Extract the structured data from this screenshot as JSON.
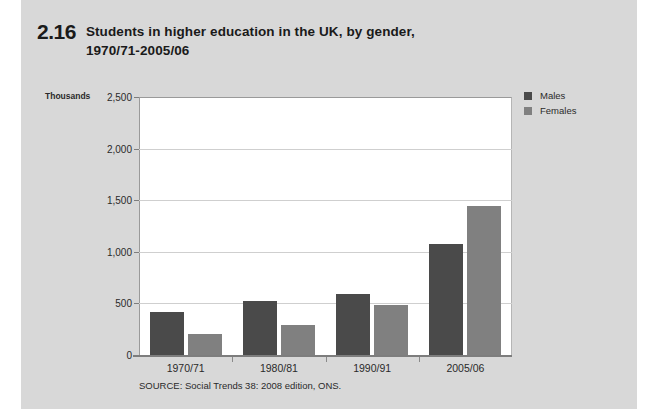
{
  "figure": {
    "number": "2.16",
    "title_line1": "Students in higher education in the UK, by gender,",
    "title_line2": "1970/71-2005/06",
    "source": "SOURCE: Social Trends 38: 2008 edition, ONS.",
    "panel_color": "#d8d8d8"
  },
  "chart_data": {
    "type": "bar",
    "title": "Students in higher education in the UK, by gender, 1970/71-2005/06",
    "xlabel": "",
    "ylabel": "Thousands",
    "unit_label": "Thousands",
    "categories": [
      "1970/71",
      "1980/81",
      "1990/91",
      "2005/06"
    ],
    "series": [
      {
        "name": "Males",
        "color": "#4a4a4a",
        "values": [
          416,
          526,
          588,
          1080
        ]
      },
      {
        "name": "Females",
        "color": "#808080",
        "values": [
          205,
          292,
          487,
          1440
        ]
      }
    ],
    "ylim": [
      0,
      2500
    ],
    "yticks": [
      0,
      500,
      1000,
      1500,
      2000,
      2500
    ],
    "ytick_labels": [
      "0",
      "500",
      "1,000",
      "1,500",
      "2,000",
      "2,500"
    ],
    "grid": true,
    "legend_position": "right",
    "legend": [
      "Males",
      "Females"
    ]
  }
}
